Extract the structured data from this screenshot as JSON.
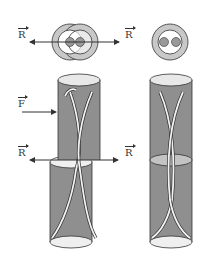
{
  "diagram": {
    "labels": {
      "r_top_left": "R",
      "r_top_right": "R",
      "f_left": "F",
      "r_mid_left": "R",
      "r_mid_right": "R"
    },
    "colors": {
      "tube_fill": "#8f8f8f",
      "tube_dark": "#6f6f6f",
      "ellipse_light": "#efefef",
      "ring_gray": "#c8c8c8",
      "string": "#f2f2f2",
      "outline": "#333333"
    },
    "figures": [
      {
        "name": "separated tubes",
        "top_view": "two offset rings",
        "forces": [
          "F",
          "R",
          "R"
        ]
      },
      {
        "name": "joined tube",
        "top_view": "single ring",
        "forces": []
      }
    ]
  }
}
